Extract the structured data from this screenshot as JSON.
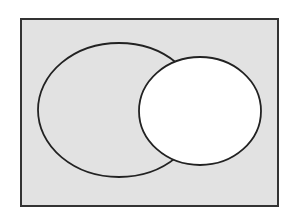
{
  "diagram": {
    "type": "venn",
    "universe": {
      "x": 21,
      "y": 19,
      "width": 257,
      "height": 187,
      "fill": "#e2e2e2",
      "stroke": "#333333"
    },
    "set_a": {
      "shape": "ellipse",
      "cx": 119,
      "cy": 110,
      "rx": 81,
      "ry": 67,
      "fill": "#e2e2e2",
      "stroke": "#222222"
    },
    "set_b": {
      "shape": "ellipse",
      "cx": 200,
      "cy": 111,
      "rx": 61,
      "ry": 54,
      "fill": "#ffffff",
      "stroke": "#222222"
    }
  }
}
